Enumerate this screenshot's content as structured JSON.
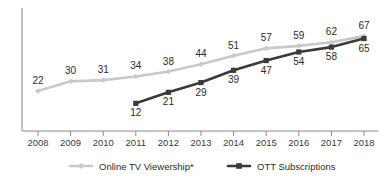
{
  "figure": {
    "title_sliver": "",
    "background": "#ffffff"
  },
  "chart_data": {
    "type": "line",
    "title": "",
    "xlabel": "",
    "ylabel": "",
    "grid": false,
    "legend_position": "bottom",
    "categories": [
      "2008",
      "2009",
      "2010",
      "2011",
      "2012",
      "2013",
      "2014",
      "2015",
      "2016",
      "2017",
      "2018"
    ],
    "x": [
      2008,
      2009,
      2010,
      2011,
      2012,
      2013,
      2014,
      2015,
      2016,
      2017,
      2018
    ],
    "ylim": [
      0,
      72
    ],
    "series": [
      {
        "name": "Online TV Viewership*",
        "color": "#c9c9c9",
        "marker": "diamond",
        "values": [
          22,
          30,
          31,
          34,
          38,
          44,
          51,
          57,
          59,
          62,
          67
        ],
        "labels": [
          "22",
          "30",
          "31",
          "34",
          "38",
          "44",
          "51",
          "57",
          "59",
          "62",
          "67"
        ]
      },
      {
        "name": "OTT Subscriptions",
        "color": "#3a3a3a",
        "marker": "square",
        "values": [
          null,
          null,
          null,
          12,
          21,
          29,
          39,
          47,
          54,
          58,
          65
        ],
        "labels": [
          "",
          "",
          "",
          "12",
          "21",
          "29",
          "39",
          "47",
          "54",
          "58",
          "65"
        ]
      }
    ],
    "axis_color": "#8a8a8a"
  },
  "legend": {
    "items": [
      {
        "label": "Online TV Viewership*",
        "color": "#c9c9c9",
        "marker": "diamond"
      },
      {
        "label": "OTT Subscriptions",
        "color": "#3a3a3a",
        "marker": "square"
      }
    ]
  }
}
